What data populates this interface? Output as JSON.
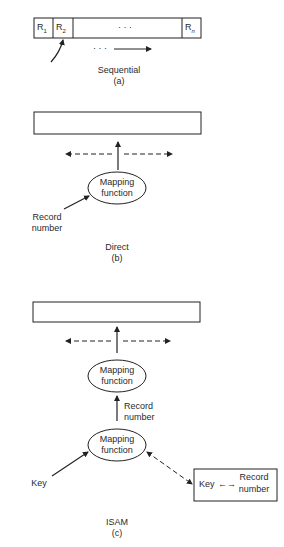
{
  "panel_a": {
    "cells": [
      "R",
      "R",
      "· · ·",
      "R"
    ],
    "cell_subs": [
      "1",
      "2",
      "",
      "n"
    ],
    "dots": "· · ·",
    "title": "Sequential",
    "label": "(a)"
  },
  "panel_b": {
    "ellipse_line1": "Mapping",
    "ellipse_line2": "function",
    "input_line1": "Record",
    "input_line2": "number",
    "title": "Direct",
    "label": "(b)"
  },
  "panel_c": {
    "upper_ellipse_line1": "Mapping",
    "upper_ellipse_line2": "function",
    "mid_label_line1": "Record",
    "mid_label_line2": "number",
    "lower_ellipse_line1": "Mapping",
    "lower_ellipse_line2": "function",
    "key_label": "Key",
    "table_key": "Key",
    "table_arrow": "←→",
    "table_rec_line1": "Record",
    "table_rec_line2": "number",
    "title": "ISAM",
    "label": "(c)"
  }
}
